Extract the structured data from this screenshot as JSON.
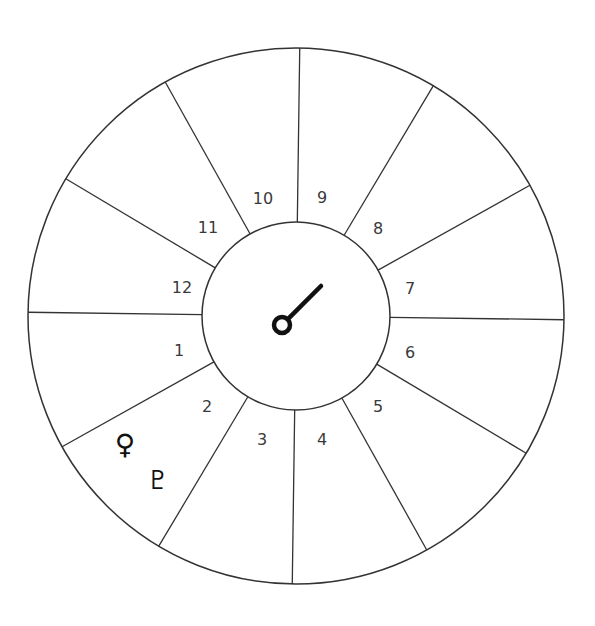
{
  "chart": {
    "center": [
      296,
      316
    ],
    "outer_radius": 268,
    "inner_radius": 94,
    "rotation_deg": 0.8,
    "line_color": "#333333",
    "house_count": 12
  },
  "houses": [
    {
      "number": "1",
      "x": 179,
      "y": 351
    },
    {
      "number": "2",
      "x": 207,
      "y": 407
    },
    {
      "number": "3",
      "x": 262,
      "y": 440
    },
    {
      "number": "4",
      "x": 322,
      "y": 440
    },
    {
      "number": "5",
      "x": 378,
      "y": 407
    },
    {
      "number": "6",
      "x": 410,
      "y": 353
    },
    {
      "number": "7",
      "x": 410,
      "y": 289
    },
    {
      "number": "8",
      "x": 378,
      "y": 229
    },
    {
      "number": "9",
      "x": 322,
      "y": 198
    },
    {
      "number": "10",
      "x": 263,
      "y": 199
    },
    {
      "number": "11",
      "x": 208,
      "y": 228
    },
    {
      "number": "12",
      "x": 182,
      "y": 288
    }
  ],
  "planets": [
    {
      "name": "Venus",
      "glyph": "♀",
      "x": 125,
      "y": 445,
      "size": 28
    },
    {
      "name": "Pluto",
      "glyph": "♇",
      "x": 158,
      "y": 480,
      "size": 26
    }
  ],
  "center_symbol": {
    "name": "Mars-like pointer",
    "ring_center": [
      282,
      325
    ],
    "ring_radius": 8,
    "line_end": [
      321,
      286
    ],
    "stroke_width": 4.5
  }
}
